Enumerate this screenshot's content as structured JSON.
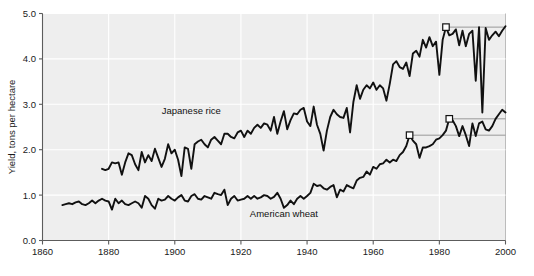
{
  "chart_data": {
    "type": "line",
    "title": "",
    "subtitle": "",
    "xlabel": "",
    "ylabel": "Yield, tons per hectare",
    "xlim": [
      1860,
      2000
    ],
    "ylim": [
      0.0,
      5.0
    ],
    "grid": true,
    "legend_position": "inline-annotation",
    "xticks": [
      1860,
      1880,
      1900,
      1920,
      1940,
      1960,
      1980,
      2000
    ],
    "xtick_labels": [
      "1860",
      "1880",
      "1900",
      "1920",
      "1940",
      "1960",
      "1980",
      "2000"
    ],
    "yticks": [
      0.0,
      1.0,
      2.0,
      3.0,
      4.0,
      5.0
    ],
    "ytick_labels": [
      "0.0",
      "1.0",
      "2.0",
      "3.0",
      "4.0",
      "5.0"
    ],
    "annotations": [
      {
        "name": "japanese-rice-label",
        "text": "Japanese rice",
        "x": 1905,
        "y": 2.78
      },
      {
        "name": "american-wheat-label",
        "text": "American wheat",
        "x": 1933,
        "y": 0.52
      }
    ],
    "markers": [
      {
        "name": "rice-record-marker",
        "series": "Japanese rice",
        "x": 1982,
        "y": 4.7,
        "shape": "open-square",
        "rule_to_x": 2000
      },
      {
        "name": "wheat-marker-1",
        "series": "American wheat",
        "x": 1971,
        "y": 2.32,
        "shape": "open-square",
        "rule_to_x": 2000
      },
      {
        "name": "wheat-marker-2",
        "series": "American wheat",
        "x": 1983,
        "y": 2.68,
        "shape": "open-square",
        "rule_to_x": 2000
      }
    ],
    "series": [
      {
        "name": "Japanese rice",
        "color": "#111111",
        "x": [
          1878,
          1879,
          1880,
          1881,
          1882,
          1883,
          1884,
          1885,
          1886,
          1887,
          1888,
          1889,
          1890,
          1891,
          1892,
          1893,
          1894,
          1895,
          1896,
          1897,
          1898,
          1899,
          1900,
          1901,
          1902,
          1903,
          1904,
          1905,
          1906,
          1907,
          1908,
          1909,
          1910,
          1911,
          1912,
          1913,
          1914,
          1915,
          1916,
          1917,
          1918,
          1919,
          1920,
          1921,
          1922,
          1923,
          1924,
          1925,
          1926,
          1927,
          1928,
          1929,
          1930,
          1931,
          1932,
          1933,
          1934,
          1935,
          1936,
          1937,
          1938,
          1939,
          1940,
          1941,
          1942,
          1943,
          1944,
          1945,
          1946,
          1947,
          1948,
          1949,
          1950,
          1951,
          1952,
          1953,
          1954,
          1955,
          1956,
          1957,
          1958,
          1959,
          1960,
          1961,
          1962,
          1963,
          1964,
          1965,
          1966,
          1967,
          1968,
          1969,
          1970,
          1971,
          1972,
          1973,
          1974,
          1975,
          1976,
          1977,
          1978,
          1979,
          1980,
          1981,
          1982,
          1983,
          1984,
          1985,
          1986,
          1987,
          1988,
          1989,
          1990,
          1991,
          1992,
          1993,
          1994,
          1995,
          1996,
          1997,
          1998,
          1999,
          2000
        ],
        "y": [
          1.58,
          1.55,
          1.58,
          1.72,
          1.7,
          1.72,
          1.45,
          1.72,
          1.92,
          1.88,
          1.68,
          1.55,
          1.95,
          1.72,
          1.88,
          1.75,
          2.02,
          1.82,
          1.62,
          1.8,
          2.12,
          1.92,
          2.0,
          1.78,
          1.42,
          2.05,
          2.02,
          1.58,
          2.12,
          2.18,
          2.22,
          2.12,
          2.05,
          2.22,
          2.28,
          2.2,
          2.12,
          2.35,
          2.35,
          2.28,
          2.25,
          2.38,
          2.42,
          2.28,
          2.42,
          2.35,
          2.48,
          2.55,
          2.48,
          2.58,
          2.55,
          2.42,
          2.72,
          2.35,
          2.62,
          2.85,
          2.45,
          2.65,
          2.8,
          2.78,
          2.88,
          2.92,
          2.62,
          2.52,
          2.95,
          2.55,
          2.35,
          1.98,
          2.42,
          2.72,
          2.88,
          2.78,
          2.72,
          2.7,
          2.92,
          2.38,
          3.05,
          3.42,
          3.12,
          3.32,
          3.42,
          3.35,
          3.48,
          3.32,
          3.42,
          3.35,
          3.08,
          3.45,
          3.88,
          3.95,
          3.82,
          3.78,
          3.92,
          3.62,
          4.12,
          4.18,
          4.05,
          4.42,
          4.25,
          4.48,
          4.28,
          4.38,
          3.65,
          4.42,
          4.7,
          4.52,
          4.55,
          4.65,
          4.3,
          4.62,
          4.28,
          4.55,
          4.62,
          3.52,
          4.7,
          2.82,
          4.68,
          4.42,
          4.52,
          4.6,
          4.5,
          4.62,
          4.72
        ]
      },
      {
        "name": "American wheat",
        "color": "#111111",
        "x": [
          1866,
          1867,
          1868,
          1869,
          1870,
          1871,
          1872,
          1873,
          1874,
          1875,
          1876,
          1877,
          1878,
          1879,
          1880,
          1881,
          1882,
          1883,
          1884,
          1885,
          1886,
          1887,
          1888,
          1889,
          1890,
          1891,
          1892,
          1893,
          1894,
          1895,
          1896,
          1897,
          1898,
          1899,
          1900,
          1901,
          1902,
          1903,
          1904,
          1905,
          1906,
          1907,
          1908,
          1909,
          1910,
          1911,
          1912,
          1913,
          1914,
          1915,
          1916,
          1917,
          1918,
          1919,
          1920,
          1921,
          1922,
          1923,
          1924,
          1925,
          1926,
          1927,
          1928,
          1929,
          1930,
          1931,
          1932,
          1933,
          1934,
          1935,
          1936,
          1937,
          1938,
          1939,
          1940,
          1941,
          1942,
          1943,
          1944,
          1945,
          1946,
          1947,
          1948,
          1949,
          1950,
          1951,
          1952,
          1953,
          1954,
          1955,
          1956,
          1957,
          1958,
          1959,
          1960,
          1961,
          1962,
          1963,
          1964,
          1965,
          1966,
          1967,
          1968,
          1969,
          1970,
          1971,
          1972,
          1973,
          1974,
          1975,
          1976,
          1977,
          1978,
          1979,
          1980,
          1981,
          1982,
          1983,
          1984,
          1985,
          1986,
          1987,
          1988,
          1989,
          1990,
          1991,
          1992,
          1993,
          1994,
          1995,
          1996,
          1997,
          1998,
          1999,
          2000
        ],
        "y": [
          0.78,
          0.8,
          0.82,
          0.8,
          0.84,
          0.86,
          0.8,
          0.78,
          0.82,
          0.88,
          0.82,
          0.88,
          0.92,
          0.88,
          0.86,
          0.68,
          0.92,
          0.82,
          0.88,
          0.8,
          0.78,
          0.82,
          0.86,
          0.82,
          0.72,
          0.98,
          0.92,
          0.78,
          0.7,
          0.92,
          0.88,
          0.9,
          0.98,
          0.92,
          0.88,
          0.95,
          1.0,
          0.88,
          0.86,
          0.98,
          1.02,
          0.92,
          0.9,
          0.98,
          0.95,
          0.92,
          1.05,
          1.02,
          1.0,
          1.12,
          0.78,
          0.92,
          0.98,
          0.88,
          0.9,
          0.92,
          0.98,
          0.92,
          0.98,
          0.92,
          0.95,
          1.0,
          0.98,
          0.92,
          0.96,
          1.05,
          0.92,
          0.72,
          0.78,
          0.88,
          0.8,
          0.92,
          0.98,
          0.92,
          0.98,
          1.05,
          1.25,
          1.2,
          1.22,
          1.15,
          1.12,
          1.18,
          1.22,
          0.95,
          1.12,
          1.08,
          1.22,
          1.18,
          1.15,
          1.32,
          1.38,
          1.4,
          1.52,
          1.45,
          1.62,
          1.58,
          1.68,
          1.7,
          1.78,
          1.72,
          1.78,
          1.75,
          1.88,
          1.95,
          2.08,
          2.32,
          2.2,
          2.12,
          1.82,
          2.05,
          2.05,
          2.08,
          2.12,
          2.22,
          2.25,
          2.32,
          2.42,
          2.68,
          2.65,
          2.52,
          2.3,
          2.52,
          2.32,
          2.08,
          2.58,
          2.3,
          2.58,
          2.62,
          2.45,
          2.42,
          2.52,
          2.68,
          2.78,
          2.88,
          2.82
        ]
      }
    ]
  },
  "figure": {
    "background_color": "#ffffff",
    "plot_background_color": "#eeeeee",
    "gridline_color": "#ffffff",
    "line_color": "#111111",
    "axis_color": "#5c5c5c"
  }
}
